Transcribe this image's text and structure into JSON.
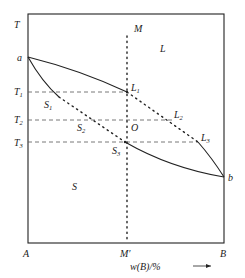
{
  "diagram": {
    "type": "binary phase diagram (solid-liquid, continuous solid solution)",
    "axes": {
      "y_label": "T",
      "x_label": "w(B)/%",
      "x_label_parts": {
        "w": "w",
        "open": "(",
        "B": "B",
        "close": ")",
        "unit": "/%"
      },
      "origin_label": "A",
      "right_label": "B",
      "composition_label": "M′"
    },
    "temperature_labels": [
      {
        "id": "T1",
        "base": "T",
        "sub": "1"
      },
      {
        "id": "T2",
        "base": "T",
        "sub": "2"
      },
      {
        "id": "T3",
        "base": "T",
        "sub": "3"
      }
    ],
    "points": {
      "a": "a",
      "b": "b",
      "M": "M",
      "O": "O",
      "L1": {
        "base": "L",
        "sub": "1"
      },
      "L2": {
        "base": "L",
        "sub": "2"
      },
      "L3": {
        "base": "L",
        "sub": "3"
      },
      "S1": {
        "base": "S",
        "sub": "1"
      },
      "S2": {
        "base": "S",
        "sub": "2"
      },
      "S3": {
        "base": "S",
        "sub": "3"
      }
    },
    "regions": {
      "liquid": "L",
      "solid": "S"
    },
    "colors": {
      "line": "#222222",
      "dashed": "#555555",
      "background": "#ffffff"
    }
  }
}
